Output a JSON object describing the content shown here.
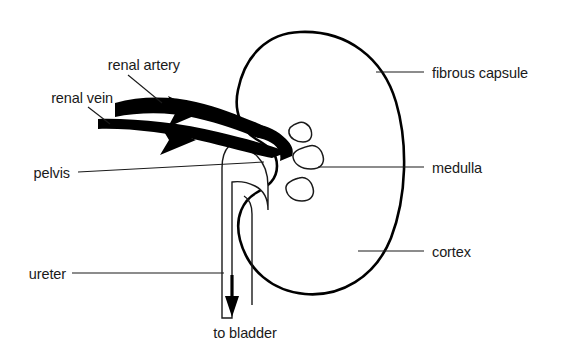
{
  "figure": {
    "background_color": "#ffffff",
    "ink_color": "#1a1a1a"
  },
  "labels": {
    "renal_artery": "renal artery",
    "renal_vein": "renal vein",
    "pelvis": "pelvis",
    "ureter": "ureter",
    "to_bladder": "to bladder",
    "fibrous_capsule": "fibrous capsule",
    "medulla": "medulla",
    "cortex": "cortex"
  },
  "structures": [
    {
      "name": "fibrous-capsule",
      "side": "right",
      "description": "outer dark boundary line of the kidney"
    },
    {
      "name": "cortex",
      "side": "right",
      "description": "stippled outer band of kidney tissue"
    },
    {
      "name": "medulla",
      "side": "right",
      "description": "inner pale region of kidney tissue"
    },
    {
      "name": "renal-pyramid",
      "side": "center",
      "count": 3,
      "description": "triangular pyramids in the medulla"
    },
    {
      "name": "renal-pelvis",
      "side": "left",
      "description": "funnel shaped collecting space at the hilum"
    },
    {
      "name": "ureter",
      "side": "left",
      "description": "tube leading down out of the pelvis"
    },
    {
      "name": "renal-artery",
      "side": "left",
      "description": "thick vessel with arrow pointing into the kidney"
    },
    {
      "name": "renal-vein",
      "side": "left",
      "description": "thick vessel with arrow pointing away from the kidney"
    }
  ],
  "flow": {
    "artery_direction": "into kidney",
    "vein_direction": "out of kidney",
    "ureter_direction": "to bladder"
  }
}
